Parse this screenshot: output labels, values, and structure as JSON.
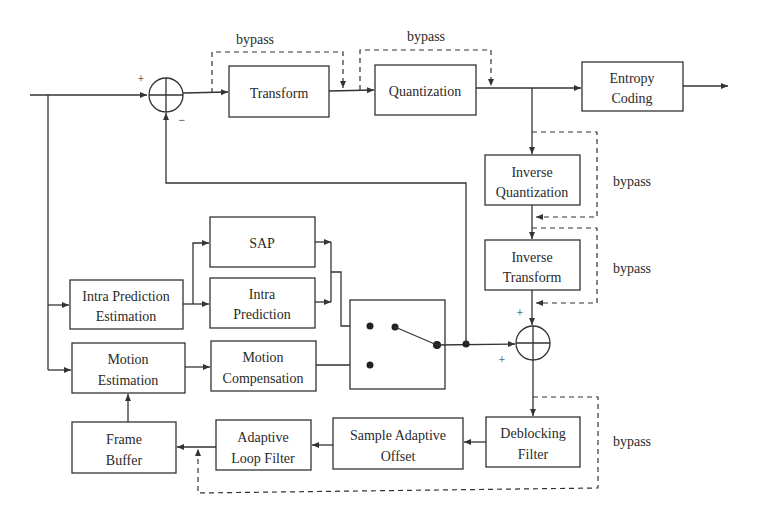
{
  "diagram": {
    "type": "block-diagram",
    "topic": "video encoder pipeline",
    "blocks": {
      "transform": {
        "lines": [
          "Transform"
        ]
      },
      "quantization": {
        "lines": [
          "Quantization"
        ]
      },
      "entropy_coding": {
        "lines": [
          "Entropy",
          "Coding"
        ]
      },
      "inverse_quantization": {
        "lines": [
          "Inverse",
          "Quantization"
        ]
      },
      "inverse_transform": {
        "lines": [
          "Inverse",
          "Transform"
        ]
      },
      "sap": {
        "lines": [
          "SAP"
        ]
      },
      "intra_prediction": {
        "lines": [
          "Intra",
          "Prediction"
        ]
      },
      "intra_prediction_estimation": {
        "lines": [
          "Intra Prediction",
          "Estimation"
        ]
      },
      "motion_estimation": {
        "lines": [
          "Motion",
          "Estimation"
        ]
      },
      "motion_compensation": {
        "lines": [
          "Motion",
          "Compensation"
        ]
      },
      "frame_buffer": {
        "lines": [
          "Frame",
          "Buffer"
        ]
      },
      "adaptive_loop_filter": {
        "lines": [
          "Adaptive",
          "Loop Filter"
        ]
      },
      "sample_adaptive_offset": {
        "lines": [
          "Sample Adaptive",
          "Offset"
        ]
      },
      "deblocking_filter": {
        "lines": [
          "Deblocking",
          "Filter"
        ]
      }
    },
    "bypass_labels": {
      "transform": "bypass",
      "quantization": "bypass",
      "inverse_quantization": "bypass",
      "inverse_transform": "bypass",
      "loop_filters": "bypass"
    },
    "summers": {
      "residual": {
        "plus": "+",
        "minus": "−"
      },
      "reconstruction": {
        "plus_top": "+",
        "plus_left": "+"
      }
    },
    "colors": {
      "stroke": "#333333",
      "background": "#ffffff",
      "text": "#2a2a2a"
    }
  }
}
